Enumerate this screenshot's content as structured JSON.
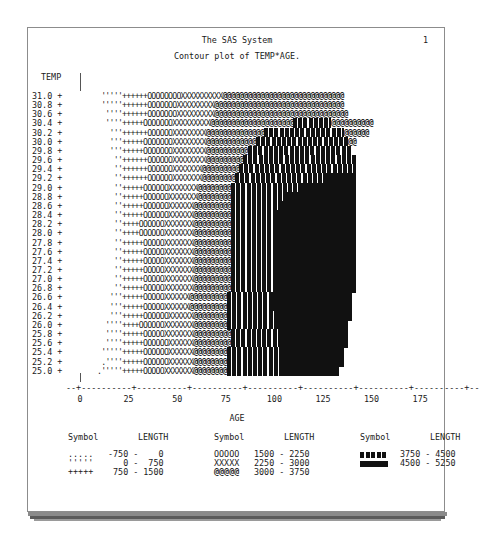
{
  "page": {
    "title": "The SAS System",
    "page_number": "1",
    "subtitle": "Contour plot of TEMP*AGE."
  },
  "chart_data": {
    "type": "heatmap",
    "title": "Contour plot of TEMP*AGE.",
    "xlabel": "AGE",
    "ylabel": "TEMP",
    "x_ticks": [
      "0",
      "25",
      "50",
      "75",
      "100",
      "125",
      "150",
      "175"
    ],
    "x_tick_values": [
      0,
      25,
      50,
      75,
      100,
      125,
      150,
      175
    ],
    "y_ticks": [
      "31.0",
      "30.8",
      "30.6",
      "30.4",
      "30.2",
      "30.0",
      "29.8",
      "29.6",
      "29.4",
      "29.2",
      "29.0",
      "28.8",
      "28.6",
      "28.4",
      "28.2",
      "28.0",
      "27.8",
      "27.6",
      "27.4",
      "27.2",
      "27.0",
      "26.8",
      "26.6",
      "26.4",
      "26.2",
      "26.0",
      "25.8",
      "25.6",
      "25.4",
      "25.2",
      "25.0"
    ],
    "xlim": [
      0,
      175
    ],
    "ylim": [
      25.0,
      31.0
    ],
    "z_variable": "LENGTH",
    "levels": [
      {
        "symbol": ".....",
        "range": "-750 -    0",
        "min": -750,
        "max": 0
      },
      {
        "symbol": "'''''",
        "range": "   0 -  750",
        "min": 0,
        "max": 750
      },
      {
        "symbol": "+++++",
        "range": " 750 - 1500",
        "min": 750,
        "max": 1500
      },
      {
        "symbol": "OOOOO",
        "range": "1500 - 2250",
        "min": 1500,
        "max": 2250
      },
      {
        "symbol": "XXXXX",
        "range": "2250 - 3000",
        "min": 2250,
        "max": 3000
      },
      {
        "symbol": "@@@@@",
        "range": "3000 - 3750",
        "min": 3000,
        "max": 3750
      },
      {
        "symbol": "█████ (hatched)",
        "range": "3750 - 4500",
        "min": 3750,
        "max": 4500
      },
      {
        "symbol": "█████ (solid)",
        "range": "4500 - 5250",
        "min": 4500,
        "max": 5250
      }
    ],
    "rows_note": "Each row lists run-lengths of characters: [dot, quote, plus, O, X, @, block1, block2, @-tail]",
    "rows": [
      {
        "y": "31.0",
        "runs": [
          0,
          5,
          6,
          8,
          10,
          29,
          0,
          0,
          0
        ]
      },
      {
        "y": "30.8",
        "runs": [
          0,
          5,
          6,
          7,
          9,
          31,
          0,
          0,
          0
        ]
      },
      {
        "y": "30.6",
        "runs": [
          0,
          4,
          6,
          7,
          9,
          32,
          0,
          0,
          0
        ]
      },
      {
        "y": "30.4",
        "runs": [
          0,
          4,
          5,
          7,
          9,
          20,
          9,
          0,
          10
        ]
      },
      {
        "y": "30.2",
        "runs": [
          0,
          3,
          6,
          6,
          8,
          14,
          19,
          0,
          6
        ]
      },
      {
        "y": "30.0",
        "runs": [
          0,
          3,
          5,
          7,
          8,
          12,
          22,
          0,
          2
        ]
      },
      {
        "y": "29.8",
        "runs": [
          0,
          3,
          5,
          7,
          8,
          10,
          25,
          0,
          0
        ]
      },
      {
        "y": "29.6",
        "runs": [
          0,
          2,
          6,
          6,
          8,
          9,
          27,
          0,
          0
        ]
      },
      {
        "y": "29.4",
        "runs": [
          0,
          2,
          6,
          6,
          7,
          9,
          28,
          0,
          0
        ]
      },
      {
        "y": "29.2",
        "runs": [
          0,
          2,
          6,
          6,
          7,
          8,
          22,
          7,
          0
        ]
      },
      {
        "y": "29.0",
        "runs": [
          0,
          2,
          5,
          6,
          7,
          8,
          16,
          14,
          0
        ]
      },
      {
        "y": "28.8",
        "runs": [
          0,
          2,
          5,
          6,
          7,
          8,
          13,
          17,
          0
        ]
      },
      {
        "y": "28.6",
        "runs": [
          0,
          2,
          5,
          6,
          6,
          9,
          12,
          18,
          0
        ]
      },
      {
        "y": "28.4",
        "runs": [
          0,
          2,
          5,
          6,
          6,
          9,
          11,
          19,
          0
        ]
      },
      {
        "y": "28.2",
        "runs": [
          0,
          2,
          4,
          6,
          7,
          9,
          11,
          19,
          0
        ]
      },
      {
        "y": "28.0",
        "runs": [
          0,
          2,
          4,
          6,
          7,
          9,
          11,
          19,
          0
        ]
      },
      {
        "y": "27.8",
        "runs": [
          0,
          2,
          5,
          5,
          7,
          9,
          11,
          19,
          0
        ]
      },
      {
        "y": "27.6",
        "runs": [
          0,
          2,
          5,
          5,
          7,
          9,
          11,
          19,
          0
        ]
      },
      {
        "y": "27.4",
        "runs": [
          0,
          2,
          5,
          5,
          7,
          9,
          11,
          19,
          0
        ]
      },
      {
        "y": "27.2",
        "runs": [
          0,
          2,
          5,
          5,
          7,
          9,
          11,
          19,
          0
        ]
      },
      {
        "y": "27.0",
        "runs": [
          0,
          2,
          5,
          5,
          7,
          9,
          11,
          19,
          0
        ]
      },
      {
        "y": "26.8",
        "runs": [
          0,
          2,
          5,
          5,
          7,
          9,
          11,
          19,
          0
        ]
      },
      {
        "y": "26.6",
        "runs": [
          0,
          3,
          5,
          5,
          6,
          9,
          11,
          19,
          0
        ]
      },
      {
        "y": "26.4",
        "runs": [
          0,
          3,
          5,
          5,
          6,
          9,
          11,
          19,
          0
        ]
      },
      {
        "y": "26.2",
        "runs": [
          0,
          3,
          5,
          6,
          6,
          8,
          12,
          18,
          0
        ]
      },
      {
        "y": "26.0",
        "runs": [
          0,
          4,
          4,
          6,
          7,
          8,
          12,
          17,
          0
        ]
      },
      {
        "y": "25.8",
        "runs": [
          0,
          4,
          5,
          5,
          7,
          9,
          12,
          16,
          0
        ]
      },
      {
        "y": "25.6",
        "runs": [
          0,
          4,
          5,
          6,
          6,
          9,
          12,
          16,
          0
        ]
      },
      {
        "y": "25.4",
        "runs": [
          0,
          5,
          5,
          6,
          6,
          8,
          13,
          15,
          0
        ]
      },
      {
        "y": "25.2",
        "runs": [
          1,
          4,
          5,
          6,
          6,
          8,
          13,
          15,
          0
        ]
      },
      {
        "y": "25.0",
        "runs": [
          1,
          5,
          5,
          5,
          7,
          8,
          13,
          14,
          0
        ]
      }
    ]
  },
  "axis": {
    "y_label": "TEMP",
    "x_label": "AGE",
    "x_axis_line": "--+----------+----------+----------+----------+----------+----------+----------+--"
  },
  "legend": {
    "header_symbol": "Symbol",
    "header_length": "LENGTH",
    "columns": [
      [
        {
          "symbol": ".....",
          "range": "-750 -    0"
        },
        {
          "symbol": "'''''",
          "range": "   0 -  750"
        },
        {
          "symbol": "+++++",
          "range": " 750 - 1500"
        }
      ],
      [
        {
          "symbol": "OOOOO",
          "range": "1500 - 2250"
        },
        {
          "symbol": "XXXXX",
          "range": "2250 - 3000"
        },
        {
          "symbol": "@@@@@",
          "range": "3000 - 3750"
        }
      ],
      [
        {
          "symbol": "hatched-block",
          "range": "3750 - 4500"
        },
        {
          "symbol": "solid-block",
          "range": "4500 - 5250"
        }
      ]
    ]
  }
}
